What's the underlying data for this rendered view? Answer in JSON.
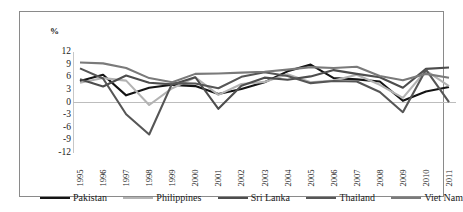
{
  "chart_data": {
    "type": "line",
    "title": "",
    "subtitle": "",
    "xlabel": "",
    "ylabel": "%",
    "ylim": [
      -12,
      12
    ],
    "yticks": [
      12,
      9,
      6,
      3,
      0,
      -3,
      -6,
      -9,
      -12
    ],
    "ytick_labels": [
      "12",
      "9",
      "6",
      "3",
      "0",
      "-3",
      "-6",
      "-9",
      "-12"
    ],
    "grid": false,
    "zero_line": true,
    "legend_position": "bottom",
    "x": [
      1995,
      1996,
      1997,
      1998,
      1999,
      2000,
      2001,
      2002,
      2003,
      2004,
      2005,
      2006,
      2007,
      2008,
      2009,
      2010,
      2011
    ],
    "xtick_labels": [
      "1995",
      "1996",
      "1997",
      "1998",
      "1999",
      "2000",
      "2001",
      "2002",
      "2003",
      "2004",
      "2005",
      "2006",
      "2007",
      "2008",
      "2009",
      "2010",
      "2011"
    ],
    "series": [
      {
        "name": "Pakistan",
        "color": "#141414",
        "width": 2.1,
        "values": [
          5.1,
          6.6,
          1.7,
          3.5,
          4.2,
          3.9,
          2.0,
          3.2,
          4.8,
          7.4,
          9.0,
          5.8,
          5.5,
          5.0,
          0.4,
          2.6,
          3.7
        ]
      },
      {
        "name": "Philippines",
        "color": "#b3b3b3",
        "width": 2.1,
        "values": [
          4.7,
          5.8,
          5.2,
          -0.6,
          3.4,
          6.0,
          1.8,
          4.4,
          4.9,
          6.7,
          4.8,
          5.2,
          6.6,
          4.2,
          1.1,
          7.6,
          3.9
        ]
      },
      {
        "name": "Sri Lanka",
        "color": "#4d4d4d",
        "width": 2.1,
        "values": [
          5.5,
          3.8,
          6.4,
          4.7,
          4.3,
          6.0,
          -1.5,
          4.0,
          5.9,
          5.4,
          6.2,
          7.7,
          6.8,
          6.0,
          3.5,
          8.0,
          8.3
        ]
      },
      {
        "name": "Thailand",
        "color": "#565656",
        "width": 2.1,
        "values": [
          8.1,
          5.7,
          -2.8,
          -7.6,
          4.6,
          4.5,
          3.4,
          6.1,
          7.2,
          6.3,
          4.6,
          5.1,
          5.0,
          2.5,
          -2.3,
          7.8,
          0.1
        ]
      },
      {
        "name": "Viet Nam",
        "color": "#7a7a7a",
        "width": 2.1,
        "values": [
          9.5,
          9.3,
          8.2,
          5.8,
          4.8,
          6.8,
          6.9,
          7.1,
          7.3,
          7.8,
          8.4,
          8.2,
          8.5,
          6.3,
          5.3,
          6.8,
          5.9
        ]
      }
    ]
  },
  "legend": {
    "items": [
      {
        "label": "Pakistan",
        "color": "#141414"
      },
      {
        "label": "Philippines",
        "color": "#b3b3b3"
      },
      {
        "label": "Sri Lanka",
        "color": "#4d4d4d"
      },
      {
        "label": "Thailand",
        "color": "#565656"
      },
      {
        "label": "Viet Nam",
        "color": "#7a7a7a"
      }
    ]
  }
}
